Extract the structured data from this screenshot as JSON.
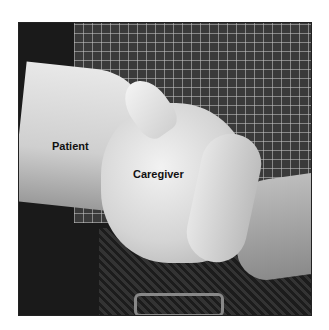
{
  "image": {
    "description": "Grayscale photograph of a caregiver's hand gripping a patient's wrist, with a plaid shirt and belt in the background",
    "labels": {
      "patient": "Patient",
      "caregiver": "Caregiver"
    }
  }
}
